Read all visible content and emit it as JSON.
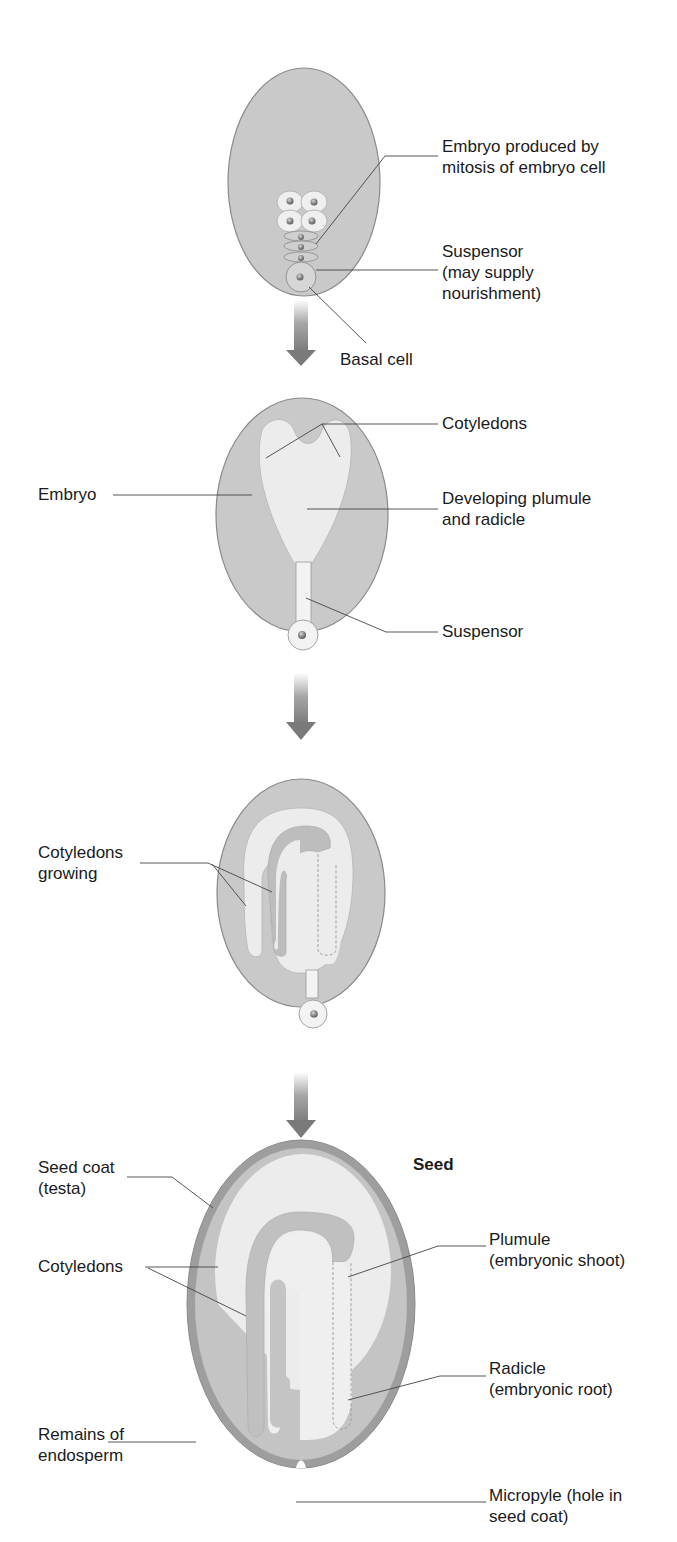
{
  "colors": {
    "tissue": "#c9c9c9",
    "tissue_stroke": "#8a8a8a",
    "embryo": "#ececec",
    "embryo_mid": "#bdbdbd",
    "seed_coat": "#9e9e9e",
    "endosperm_band": "#c4c4c4",
    "arrow": "#808080",
    "leader": "#444444",
    "text": "#1b1b1b"
  },
  "stages": [
    {
      "name": "early-embryo",
      "labels": [
        {
          "id": "embryo_mitosis",
          "lines": [
            "Embryo produced by",
            "mitosis of embryo cell"
          ]
        },
        {
          "id": "suspensor_1",
          "lines": [
            "Suspensor",
            "(may supply",
            "nourishment)"
          ]
        },
        {
          "id": "basal_cell",
          "lines": [
            "Basal cell"
          ]
        }
      ]
    },
    {
      "name": "heart-stage-embryo",
      "labels": [
        {
          "id": "cotyledons_1",
          "lines": [
            "Cotyledons"
          ]
        },
        {
          "id": "embryo",
          "lines": [
            "Embryo"
          ]
        },
        {
          "id": "plumule_radicle",
          "lines": [
            "Developing plumule",
            "and radicle"
          ]
        },
        {
          "id": "suspensor_2",
          "lines": [
            "Suspensor"
          ]
        }
      ]
    },
    {
      "name": "torpedo-stage-embryo",
      "labels": [
        {
          "id": "cotyledons_growing",
          "lines": [
            "Cotyledons",
            "growing"
          ]
        }
      ]
    },
    {
      "name": "seed",
      "title": "Seed",
      "labels": [
        {
          "id": "seed_coat",
          "lines": [
            "Seed coat",
            "(testa)"
          ]
        },
        {
          "id": "cotyledons_2",
          "lines": [
            "Cotyledons"
          ]
        },
        {
          "id": "plumule",
          "lines": [
            "Plumule",
            "(embryonic shoot)"
          ]
        },
        {
          "id": "radicle",
          "lines": [
            "Radicle",
            "(embryonic root)"
          ]
        },
        {
          "id": "endosperm",
          "lines": [
            "Remains of",
            "endosperm"
          ]
        },
        {
          "id": "micropyle",
          "lines": [
            "Micropyle (hole in",
            "seed coat)"
          ]
        }
      ]
    }
  ]
}
